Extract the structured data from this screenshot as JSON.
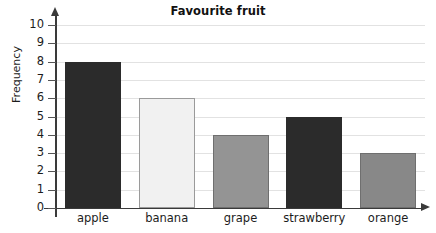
{
  "chart_data": {
    "type": "bar",
    "title": "Favourite fruit",
    "xlabel": "",
    "ylabel": "Frequency",
    "categories": [
      "apple",
      "banana",
      "grape",
      "strawberry",
      "orange"
    ],
    "values": [
      8,
      6,
      4,
      5,
      3
    ],
    "ylim": [
      0,
      10
    ],
    "y_ticks": [
      0,
      1,
      2,
      3,
      4,
      5,
      6,
      7,
      8,
      9,
      10
    ],
    "y_tick_labels": [
      "0",
      "1",
      "2",
      "3",
      "4",
      "5",
      "6",
      "7",
      "8",
      "9",
      "10"
    ],
    "grid": true,
    "grid_axis": "y",
    "legend": false,
    "legend_position": "none",
    "bar_colors": [
      "#2b2b2b",
      "#f1f1f1",
      "#949494",
      "#2b2b2b",
      "#888888"
    ],
    "bar_border_colors": [
      "#2b2b2b",
      "#9a9a9a",
      "#6f6f6f",
      "#2b2b2b",
      "#6f6f6f"
    ],
    "series": [
      {
        "name": "Frequency",
        "values": [
          8,
          6,
          4,
          5,
          3
        ]
      }
    ],
    "points": [
      {
        "category": "apple",
        "value": 8
      },
      {
        "category": "banana",
        "value": 6
      },
      {
        "category": "grape",
        "value": 4
      },
      {
        "category": "strawberry",
        "value": 5
      },
      {
        "category": "orange",
        "value": 3
      }
    ]
  },
  "colors": {
    "background": "#ffffff",
    "axis": "#3a3a3a",
    "gridline": "#e2e2e2",
    "text": "#1c1c1c"
  }
}
